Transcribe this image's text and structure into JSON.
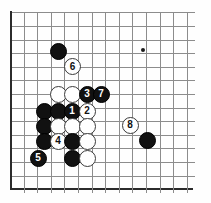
{
  "figure": {
    "type": "go-board-diagram",
    "board": {
      "grid_columns": 14,
      "grid_rows": 14,
      "origin_x": 10,
      "origin_y": 12.4,
      "spacing": 13.6,
      "line_color": "#8c8c8c",
      "edge_color": "#2b2b2b",
      "background_color": "#fefefe",
      "star_points": [
        {
          "col": 9.8,
          "row": 2.8
        }
      ]
    },
    "stones": [
      {
        "id": "stone-black-a",
        "color": "black",
        "label": "",
        "x": 58,
        "y": 51
      },
      {
        "id": "stone-white-6",
        "color": "white",
        "label": "6",
        "x": 72.5,
        "y": 66.5
      },
      {
        "id": "stone-white-b",
        "color": "white",
        "label": "",
        "x": 58,
        "y": 94.5
      },
      {
        "id": "stone-white-c",
        "color": "white",
        "label": "",
        "x": 72,
        "y": 94.5
      },
      {
        "id": "stone-black-3",
        "color": "black",
        "label": "3",
        "x": 87,
        "y": 94
      },
      {
        "id": "stone-black-7",
        "color": "black",
        "label": "7",
        "x": 101,
        "y": 94
      },
      {
        "id": "stone-black-d",
        "color": "black",
        "label": "",
        "x": 44,
        "y": 111
      },
      {
        "id": "stone-black-e",
        "color": "black",
        "label": "",
        "x": 58,
        "y": 111
      },
      {
        "id": "stone-black-1",
        "color": "black",
        "label": "1",
        "x": 72,
        "y": 111
      },
      {
        "id": "stone-white-2",
        "color": "white",
        "label": "2",
        "x": 87,
        "y": 111
      },
      {
        "id": "stone-black-f",
        "color": "black",
        "label": "",
        "x": 44,
        "y": 126
      },
      {
        "id": "stone-white-g",
        "color": "white",
        "label": "",
        "x": 58,
        "y": 126
      },
      {
        "id": "stone-white-h",
        "color": "white",
        "label": "",
        "x": 72,
        "y": 126
      },
      {
        "id": "stone-white-i",
        "color": "white",
        "label": "",
        "x": 87,
        "y": 126
      },
      {
        "id": "stone-white-8",
        "color": "white",
        "label": "8",
        "x": 130,
        "y": 125
      },
      {
        "id": "stone-black-j",
        "color": "black",
        "label": "",
        "x": 44,
        "y": 141
      },
      {
        "id": "stone-white-4",
        "color": "white",
        "label": "4",
        "x": 58,
        "y": 141
      },
      {
        "id": "stone-black-k",
        "color": "black",
        "label": "",
        "x": 72,
        "y": 141
      },
      {
        "id": "stone-white-l",
        "color": "white",
        "label": "",
        "x": 87,
        "y": 141
      },
      {
        "id": "stone-black-m",
        "color": "black",
        "label": "",
        "x": 147,
        "y": 140
      },
      {
        "id": "stone-black-5",
        "color": "black",
        "label": "5",
        "x": 38,
        "y": 158
      },
      {
        "id": "stone-black-n",
        "color": "black",
        "label": "",
        "x": 72,
        "y": 158
      },
      {
        "id": "stone-white-o",
        "color": "white",
        "label": "",
        "x": 87,
        "y": 158
      }
    ],
    "move_numbers": [
      "1",
      "2",
      "3",
      "4",
      "5",
      "6",
      "7",
      "8"
    ]
  }
}
